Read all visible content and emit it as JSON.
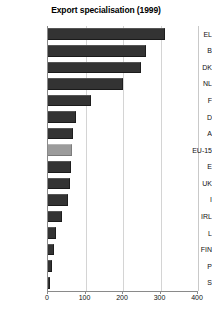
{
  "chart_data": {
    "type": "bar",
    "orientation": "horizontal",
    "title": "Export specialisation (1999)",
    "xlabel": "",
    "ylabel": "",
    "xlim": [
      0,
      400
    ],
    "xticks": [
      0,
      100,
      200,
      300,
      400
    ],
    "xtick_labels": [
      "0",
      "100",
      "200",
      "300",
      "400"
    ],
    "grid": true,
    "grid_axis": "x",
    "legend": false,
    "highlight_category": "EU-15",
    "bar_color": "#333333",
    "highlight_color": "#9b9b9b",
    "categories": [
      "EL",
      "B",
      "DK",
      "NL",
      "F",
      "D",
      "A",
      "EU-15",
      "E",
      "UK",
      "I",
      "IRL",
      "L",
      "FIN",
      "P",
      "S"
    ],
    "values": [
      313,
      262,
      248,
      200,
      115,
      74,
      66,
      64,
      62,
      58,
      52,
      38,
      22,
      17,
      10,
      4
    ],
    "bars": [
      {
        "category": "EL",
        "value": 313,
        "highlighted": false
      },
      {
        "category": "B",
        "value": 262,
        "highlighted": false
      },
      {
        "category": "DK",
        "value": 248,
        "highlighted": false
      },
      {
        "category": "NL",
        "value": 200,
        "highlighted": false
      },
      {
        "category": "F",
        "value": 115,
        "highlighted": false
      },
      {
        "category": "D",
        "value": 74,
        "highlighted": false
      },
      {
        "category": "A",
        "value": 66,
        "highlighted": false
      },
      {
        "category": "EU-15",
        "value": 64,
        "highlighted": true
      },
      {
        "category": "E",
        "value": 62,
        "highlighted": false
      },
      {
        "category": "UK",
        "value": 58,
        "highlighted": false
      },
      {
        "category": "I",
        "value": 52,
        "highlighted": false
      },
      {
        "category": "IRL",
        "value": 38,
        "highlighted": false
      },
      {
        "category": "L",
        "value": 22,
        "highlighted": false
      },
      {
        "category": "FIN",
        "value": 17,
        "highlighted": false
      },
      {
        "category": "P",
        "value": 10,
        "highlighted": false
      },
      {
        "category": "S",
        "value": 4,
        "highlighted": false
      }
    ]
  }
}
